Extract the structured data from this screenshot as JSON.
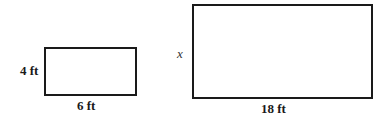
{
  "small_rectangle": {
    "height_label": "4 ft",
    "width_label": "6 ft"
  },
  "large_rectangle": {
    "height_label": "x",
    "width_label": "18 ft"
  }
}
